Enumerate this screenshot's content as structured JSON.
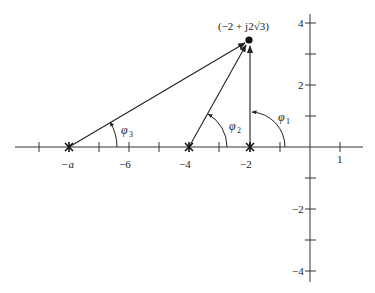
{
  "diagram": {
    "type": "s-plane pole-zero angle diagram",
    "test_point": {
      "label": "(−2 + j2√3)",
      "re": -2,
      "im": 3.4641
    },
    "poles": [
      {
        "label": "−a",
        "re": -8
      },
      {
        "label": "−4",
        "re": -4
      },
      {
        "label": "−2",
        "re": -2
      }
    ],
    "angles": [
      {
        "label": "φ",
        "sub": "1",
        "from_pole": "−2"
      },
      {
        "label": "φ",
        "sub": "2",
        "from_pole": "−4"
      },
      {
        "label": "φ",
        "sub": "3",
        "from_pole": "−a"
      }
    ],
    "x_axis": {
      "tick_labels": [
        {
          "value": -8,
          "text": "−a"
        },
        {
          "value": -6,
          "text": "−6"
        },
        {
          "value": -4,
          "text": "−4"
        },
        {
          "value": -2,
          "text": "−2"
        },
        {
          "value": 1,
          "text": "1"
        }
      ],
      "ticks": [
        -9,
        -8,
        -7,
        -6,
        -5,
        -4,
        -3,
        -2,
        -1,
        1
      ]
    },
    "y_axis": {
      "tick_labels": [
        {
          "value": 4,
          "text": "4"
        },
        {
          "value": 2,
          "text": "2"
        },
        {
          "value": -2,
          "text": "−2"
        },
        {
          "value": -4,
          "text": "−4"
        }
      ],
      "ticks": [
        4,
        3,
        2,
        1,
        -1,
        -2,
        -3,
        -4
      ]
    }
  },
  "labels": {
    "point": "(−2 + j2√3)",
    "neg_a": "−a",
    "neg6": "−6",
    "neg4": "−4",
    "neg2": "−2",
    "pos1": "1",
    "y4": "4",
    "y2": "2",
    "yneg2": "−2",
    "yneg4": "−4",
    "phi": "φ",
    "sub1": "1",
    "sub2": "2",
    "sub3": "3"
  }
}
